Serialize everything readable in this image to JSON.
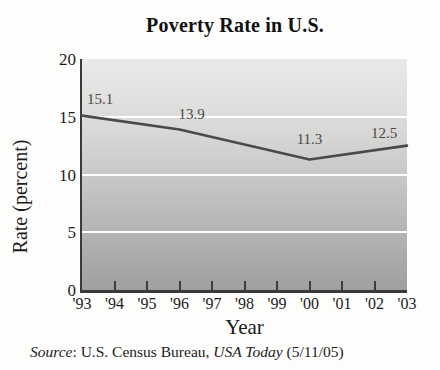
{
  "chart_data": {
    "type": "line",
    "title": "Poverty Rate in U.S.",
    "xlabel": "Year",
    "ylabel": "Rate (percent)",
    "categories": [
      "'93",
      "'94",
      "'95",
      "'96",
      "'97",
      "'98",
      "'99",
      "'00",
      "'01",
      "'02",
      "'03"
    ],
    "y_ticks": [
      0,
      5,
      10,
      15,
      20
    ],
    "ylim": [
      0,
      20
    ],
    "grid": "white horizontal gridlines at 5, 10, 15",
    "legend": "none",
    "series": [
      {
        "name": "Poverty rate (percent)",
        "points": [
          {
            "x": "'93",
            "value": 15.1,
            "label": "15.1"
          },
          {
            "x": "'96",
            "value": 13.9,
            "label": "13.9"
          },
          {
            "x": "'00",
            "value": 11.3,
            "label": "11.3"
          },
          {
            "x": "'03",
            "value": 12.5,
            "label": "12.5"
          }
        ]
      }
    ],
    "colors": {
      "line": "#4a4a4a",
      "plot_bg_top": "#eaeae8",
      "plot_bg_bottom": "#9f9f9d",
      "gridline": "#ffffff",
      "axis": "#3a3a3a",
      "data_label_text": "#4a4a4a",
      "page_bg": "#fdfdfc"
    }
  },
  "source": {
    "parts": [
      {
        "text": "Source",
        "italic": true
      },
      {
        "text": ": U.S. Census Bureau, ",
        "italic": false
      },
      {
        "text": "USA Today",
        "italic": true
      },
      {
        "text": " (5/11/05)",
        "italic": false
      }
    ]
  }
}
